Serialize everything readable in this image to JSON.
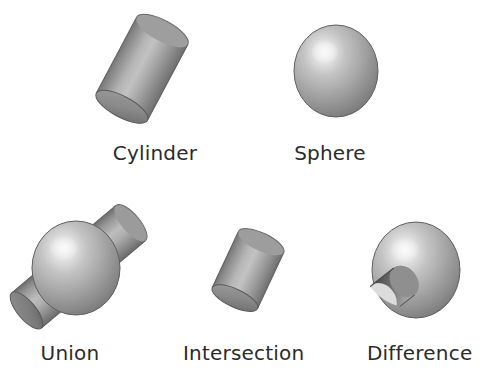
{
  "figure": {
    "background_color": "#ffffff",
    "label_color": "#2b2b2b",
    "shading": {
      "highlight_color": "#f2f2f2",
      "mid_color": "#a8a8a8",
      "shadow_color": "#6b6b6b",
      "dark_edge_color": "#555555",
      "outline_color": "#4a4a4a"
    },
    "rows": [
      {
        "name": "primitives",
        "items": [
          {
            "id": "cylinder",
            "label": "Cylinder",
            "shape": "cylinder",
            "label_left": 112,
            "label_top": 143,
            "label_width": 86
          },
          {
            "id": "sphere",
            "label": "Sphere",
            "shape": "sphere",
            "label_left": 292,
            "label_top": 143,
            "label_width": 76
          }
        ]
      },
      {
        "name": "operations",
        "items": [
          {
            "id": "union",
            "label": "Union",
            "shape": "sphere-union-cylinder",
            "label_left": 36,
            "label_top": 343,
            "label_width": 68
          },
          {
            "id": "intersection",
            "label": "Intersection",
            "shape": "short-cylinder",
            "label_left": 183,
            "label_top": 343,
            "label_width": 120
          },
          {
            "id": "difference",
            "label": "Difference",
            "shape": "sphere-minus-cylinder",
            "label_left": 367,
            "label_top": 343,
            "label_width": 100
          }
        ]
      }
    ]
  }
}
